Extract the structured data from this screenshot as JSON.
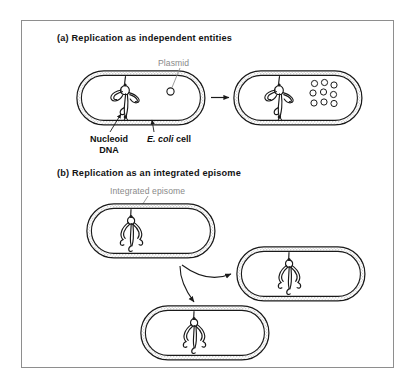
{
  "figure": {
    "frame_color": "#8e8e8e",
    "background": "#ffffff",
    "ink_color": "#1a1a1a",
    "label_gray": "#8a8a8a",
    "wall_fill": "#c9c9c9"
  },
  "panels": [
    {
      "id": "a",
      "title": "(a) Replication as independent entities",
      "labels": {
        "plasmid": "Plasmid",
        "nucleoid": "Nucleoid\nDNA",
        "nucleoid_line1": "Nucleoid",
        "nucleoid_line2": "DNA",
        "host_cell_prefix": "E.",
        "host_cell_species": "coli",
        "host_cell_suffix": "cell",
        "host_cell_full": "E. coli cell"
      },
      "cells": [
        {
          "name": "parent-cell",
          "plasmid_count": 1,
          "has_nucleoid": true
        },
        {
          "name": "daughter-cell",
          "plasmid_count": 9,
          "has_nucleoid": true
        }
      ],
      "arrows": [
        {
          "name": "replication-arrow",
          "type": "straight",
          "direction": "right"
        }
      ]
    },
    {
      "id": "b",
      "title": "(b) Replication as an integrated episome",
      "labels": {
        "episome": "Integrated episome"
      },
      "cells": [
        {
          "name": "parent-cell",
          "plasmid_count": 0,
          "has_nucleoid": true,
          "integrated": true
        },
        {
          "name": "daughter-cell-upper",
          "plasmid_count": 0,
          "has_nucleoid": true,
          "integrated": true
        },
        {
          "name": "daughter-cell-lower",
          "plasmid_count": 0,
          "has_nucleoid": true,
          "integrated": true
        }
      ],
      "arrows": [
        {
          "name": "division-arrow-upper",
          "type": "curved",
          "direction": "upper-right"
        },
        {
          "name": "division-arrow-lower",
          "type": "curved",
          "direction": "lower-right"
        }
      ]
    }
  ]
}
